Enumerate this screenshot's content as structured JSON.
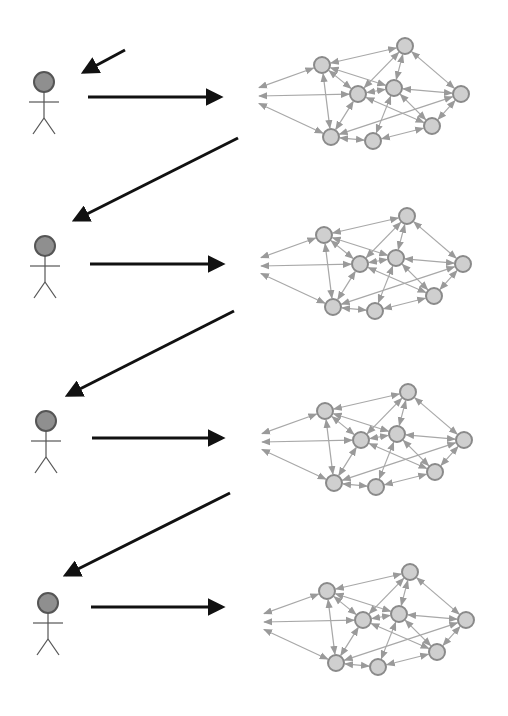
{
  "diagram": {
    "colors": {
      "background": "#ffffff",
      "actor_head_fill": "#8f8f8f",
      "actor_head_stroke": "#555555",
      "actor_body": "#555555",
      "main_arrow": "#111111",
      "node_fill": "#cfcfcf",
      "node_stroke": "#8a8a8a",
      "edge": "#a8a8a8"
    },
    "network_template": {
      "nodes": [
        {
          "id": "a",
          "dx": 0,
          "dy": 0
        },
        {
          "id": "b",
          "dx": 83,
          "dy": -19
        },
        {
          "id": "c",
          "dx": 36,
          "dy": 29
        },
        {
          "id": "d",
          "dx": 72,
          "dy": 23
        },
        {
          "id": "e",
          "dx": 139,
          "dy": 29
        },
        {
          "id": "f",
          "dx": 9,
          "dy": 72
        },
        {
          "id": "g",
          "dx": 51,
          "dy": 76
        },
        {
          "id": "h",
          "dx": 110,
          "dy": 61
        }
      ],
      "edges": [
        [
          "a",
          "b"
        ],
        [
          "a",
          "c"
        ],
        [
          "a",
          "d"
        ],
        [
          "a",
          "f"
        ],
        [
          "b",
          "c"
        ],
        [
          "b",
          "d"
        ],
        [
          "b",
          "e"
        ],
        [
          "c",
          "d"
        ],
        [
          "c",
          "f"
        ],
        [
          "c",
          "h"
        ],
        [
          "d",
          "e"
        ],
        [
          "d",
          "g"
        ],
        [
          "d",
          "h"
        ],
        [
          "e",
          "f"
        ],
        [
          "e",
          "h"
        ],
        [
          "f",
          "g"
        ],
        [
          "g",
          "h"
        ],
        [
          "L1",
          "a"
        ],
        [
          "L2",
          "c"
        ],
        [
          "L3",
          "f"
        ]
      ],
      "left_anchors": [
        {
          "id": "L1",
          "dx": -64,
          "dy": 23
        },
        {
          "id": "L2",
          "dx": -64,
          "dy": 31
        },
        {
          "id": "L3",
          "dx": -64,
          "dy": 38
        }
      ]
    },
    "stages": [
      {
        "label": "stage-1",
        "actor": {
          "x": 44,
          "y": 82
        },
        "main_arrow": {
          "x1": 88,
          "y1": 97,
          "x2": 220,
          "y2": 97
        },
        "feedback_arrow": {
          "x1": 125,
          "y1": 50,
          "x2": 84,
          "y2": 72
        },
        "network_origin": {
          "x": 322,
          "y": 65
        }
      },
      {
        "label": "stage-2",
        "actor": {
          "x": 45,
          "y": 246
        },
        "main_arrow": {
          "x1": 90,
          "y1": 264,
          "x2": 222,
          "y2": 264
        },
        "feedback_arrow": {
          "x1": 238,
          "y1": 138,
          "x2": 75,
          "y2": 220
        },
        "network_origin": {
          "x": 324,
          "y": 235
        }
      },
      {
        "label": "stage-3",
        "actor": {
          "x": 46,
          "y": 421
        },
        "main_arrow": {
          "x1": 92,
          "y1": 438,
          "x2": 222,
          "y2": 438
        },
        "feedback_arrow": {
          "x1": 234,
          "y1": 311,
          "x2": 68,
          "y2": 395
        },
        "network_origin": {
          "x": 325,
          "y": 411
        }
      },
      {
        "label": "stage-4",
        "actor": {
          "x": 48,
          "y": 603
        },
        "main_arrow": {
          "x1": 91,
          "y1": 607,
          "x2": 222,
          "y2": 607
        },
        "feedback_arrow": {
          "x1": 230,
          "y1": 493,
          "x2": 66,
          "y2": 575
        },
        "network_origin": {
          "x": 327,
          "y": 591
        }
      }
    ]
  }
}
